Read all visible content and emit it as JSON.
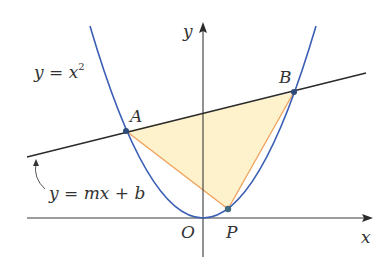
{
  "figure": {
    "colors": {
      "parabola": "#3b5fb4",
      "line": "#2a2a2a",
      "axes": "#3a3a3a",
      "triangle_fill": "#fdf2cc",
      "triangle_edge": "#f0a05a",
      "points": "#2d4a7a"
    }
  },
  "labels": {
    "parabola_eq": "y = x",
    "parabola_exp": "2",
    "line_eq": "y = mx + b",
    "y_axis": "y",
    "x_axis": "x",
    "origin": "O",
    "point_a": "A",
    "point_b": "B",
    "point_p": "P"
  },
  "geometry": {
    "origin_px": [
      203,
      218
    ],
    "point_a_px": [
      126,
      131
    ],
    "point_b_px": [
      294,
      92
    ],
    "point_p_px": [
      228,
      209
    ],
    "line_start_px": [
      27,
      157
    ],
    "line_end_px": [
      366,
      73
    ]
  }
}
